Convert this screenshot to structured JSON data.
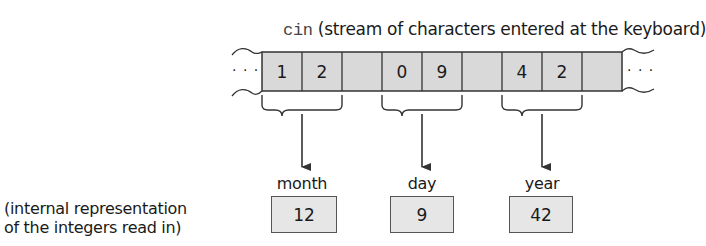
{
  "title": {
    "stream_name": "cin",
    "description": "(stream of characters entered at the keyboard)"
  },
  "stream": {
    "ellipsis_left": "· · ·",
    "ellipsis_right": "· · ·",
    "cells": [
      "1",
      "2",
      "",
      "0",
      "9",
      "",
      "4",
      "2",
      ""
    ]
  },
  "variables": [
    {
      "name": "month",
      "value": "12"
    },
    {
      "name": "day",
      "value": "9"
    },
    {
      "name": "year",
      "value": "42"
    }
  ],
  "caption": {
    "line1": "(internal representation",
    "line2": "of the integers read in)"
  },
  "colors": {
    "cell_fill": "#d9d9d9",
    "box_fill": "#e6e6e6",
    "stroke": "#333333"
  }
}
